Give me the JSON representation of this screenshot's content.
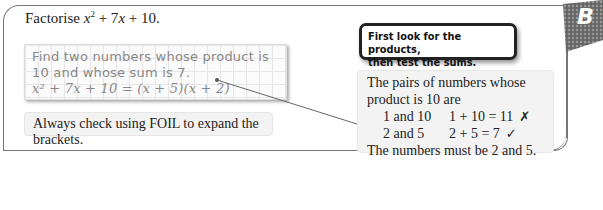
{
  "badge": {
    "letter": "B",
    "color": "#555555"
  },
  "title": {
    "prefix": "Factorise ",
    "expr_x": "x",
    "exp": "2",
    "rest": " + 7",
    "expr_x2": "x",
    "tail": " + 10."
  },
  "notebook": {
    "line1": "Find two numbers whose product is",
    "line2": "10 and whose sum is 7.",
    "line3": "x² + 7x + 10 = (x + 5)(x + 2)"
  },
  "tip": {
    "text": "Always check using FOIL to expand the brackets."
  },
  "callout": {
    "line1": "First look for the products,",
    "line2": "then test the sums."
  },
  "explanation": {
    "intro1": "The pairs of numbers whose",
    "intro2": "product is 10 are",
    "pairs": [
      {
        "pair": "1 and 10",
        "sum": "1 + 10 = 11",
        "mark": "✗"
      },
      {
        "pair": "2 and 5",
        "sum": "2 + 5 = 7",
        "mark": "✓"
      }
    ],
    "conclusion": "The numbers must be 2 and 5."
  }
}
